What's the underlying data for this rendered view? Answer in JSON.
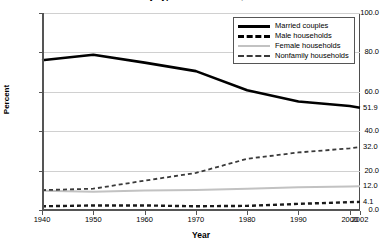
{
  "chart_data": {
    "type": "line",
    "title": "Households by Type: Selected Years, 1940-2002",
    "xlabel": "Year",
    "ylabel": "Percent",
    "xlim": [
      1940,
      2002
    ],
    "ylim": [
      0,
      100
    ],
    "grid": true,
    "legend_position": "top-right",
    "ytick_labels": [
      "100.0",
      "80.0",
      "60.0",
      "40.0",
      "20.0",
      "0.0"
    ],
    "ytick_values": [
      100,
      80,
      60,
      40,
      20,
      0
    ],
    "xtick_labels": [
      "1940",
      "1950",
      "1960",
      "1970",
      "1980",
      "1990",
      "2000",
      "2002"
    ],
    "xtick_values": [
      1940,
      1950,
      1960,
      1970,
      1980,
      1990,
      2000,
      2002
    ],
    "x": [
      1940,
      1950,
      1960,
      1970,
      1980,
      1990,
      2000,
      2002
    ],
    "series": [
      {
        "name": "Married couples",
        "style": "solid-thick",
        "color": "#000000",
        "values": [
          76.0,
          78.8,
          74.8,
          70.5,
          60.8,
          55.1,
          52.8,
          51.9
        ],
        "end_label": "51.9"
      },
      {
        "name": "Male households",
        "style": "dashed-thick",
        "color": "#1a1a1a",
        "values": [
          1.9,
          2.3,
          2.3,
          1.9,
          2.1,
          3.1,
          4.0,
          4.1
        ],
        "end_label": "4.1"
      },
      {
        "name": "Female households",
        "style": "solid-gray",
        "color": "#c2c2c2",
        "values": [
          9.8,
          9.3,
          9.9,
          10.1,
          10.8,
          11.6,
          11.9,
          12.0
        ],
        "end_label": "12.0"
      },
      {
        "name": "Nonfamily households",
        "style": "dashed-thin",
        "color": "#3a3a3a",
        "values": [
          10.1,
          10.8,
          14.9,
          18.8,
          26.0,
          29.2,
          31.3,
          32.0
        ],
        "end_label": "32.0"
      }
    ]
  }
}
